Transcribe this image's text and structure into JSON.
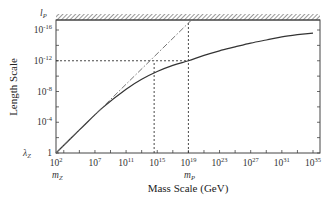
{
  "chart_data": {
    "type": "line",
    "title": "",
    "xlabel": "Mass Scale (GeV)",
    "ylabel": "Length Scale",
    "x_scale": "log",
    "y_scale": "log",
    "xlim_log10": [
      2,
      35
    ],
    "ylim_log10": [
      0,
      -16
    ],
    "x_ticks": [
      {
        "exp": "2",
        "log10": 2
      },
      {
        "exp": "7",
        "log10": 7
      },
      {
        "exp": "11",
        "log10": 11
      },
      {
        "exp": "15",
        "log10": 15
      },
      {
        "exp": "19",
        "log10": 19
      },
      {
        "exp": "23",
        "log10": 23
      },
      {
        "exp": "27",
        "log10": 27
      },
      {
        "exp": "31",
        "log10": 31
      },
      {
        "exp": "35",
        "log10": 35
      }
    ],
    "y_ticks": [
      {
        "label": "1",
        "exp": "",
        "log10": 0
      },
      {
        "label": "10",
        "exp": "-4",
        "log10": -4
      },
      {
        "label": "10",
        "exp": "-8",
        "log10": -8
      },
      {
        "label": "10",
        "exp": "-12",
        "log10": -12
      },
      {
        "label": "10",
        "exp": "-16",
        "log10": -16
      }
    ],
    "special_labels": {
      "x_left": {
        "base": "m",
        "sub": "Z"
      },
      "x_planck": {
        "base": "m",
        "sub": "P"
      },
      "y_bottom": {
        "base": "λ",
        "sub": "Z"
      },
      "y_top": {
        "base": "l",
        "sub": "P"
      }
    },
    "series": [
      {
        "name": "length scale curve",
        "style": "solid",
        "points_log10": [
          [
            2,
            0
          ],
          [
            5,
            -3
          ],
          [
            8,
            -5.9
          ],
          [
            11,
            -8.3
          ],
          [
            13,
            -9.6
          ],
          [
            15,
            -10.6
          ],
          [
            17,
            -11.4
          ],
          [
            19,
            -12
          ],
          [
            21,
            -12.7
          ],
          [
            23,
            -13.3
          ],
          [
            25,
            -13.8
          ],
          [
            27,
            -14.3
          ],
          [
            29,
            -14.7
          ],
          [
            31,
            -15.1
          ],
          [
            33,
            -15.4
          ],
          [
            35,
            -15.6
          ]
        ]
      },
      {
        "name": "linear extrapolation",
        "style": "dash-dot",
        "points_log10": [
          [
            2,
            0
          ],
          [
            19,
            -16.9
          ]
        ]
      }
    ],
    "reference_lines": [
      {
        "type": "horizontal",
        "style": "dashed",
        "y_log10": -12,
        "x_from_log10": 2,
        "x_to_log10": 19
      },
      {
        "type": "vertical",
        "style": "dashed",
        "x_log10": 14.6,
        "y_from_log10": 0,
        "y_to_log10": -12
      },
      {
        "type": "vertical",
        "style": "dashed",
        "x_log10": 19,
        "y_from_log10": 0,
        "y_to_log10": -16.9
      }
    ],
    "planck_boundary": {
      "style": "hatched",
      "position": "top"
    },
    "grid": false,
    "legend": null
  }
}
